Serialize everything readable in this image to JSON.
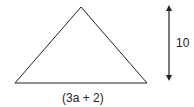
{
  "diagram": {
    "shape": "triangle",
    "stroke_color": "#222222",
    "vertices": [
      [
        81,
        7
      ],
      [
        15,
        83
      ],
      [
        147,
        83
      ]
    ],
    "height_arrow": {
      "x": 169,
      "y1": 4,
      "y2": 82
    },
    "labels": {
      "height": "10",
      "base": "(3a + 2)"
    }
  }
}
